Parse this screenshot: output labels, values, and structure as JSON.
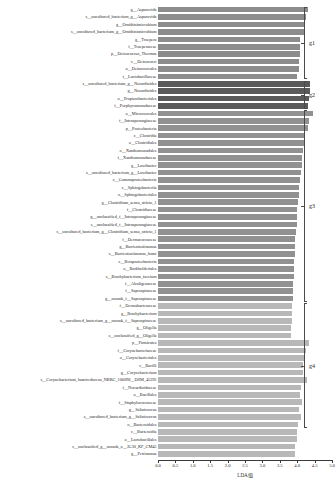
{
  "chart_data": {
    "type": "bar",
    "orientation": "horizontal",
    "title": "",
    "xlabel": "LDA值",
    "ylabel": "",
    "xlim": [
      0.0,
      5.0
    ],
    "grid": false,
    "legend_position": "right-brackets",
    "xticks": [
      "0.0",
      "0.5",
      "1.0",
      "1.5",
      "2.0",
      "2.5",
      "3.0",
      "3.5",
      "4.0",
      "4.5",
      "5.0"
    ],
    "xtick_values": [
      0.0,
      0.5,
      1.0,
      1.5,
      2.0,
      2.5,
      3.0,
      3.5,
      4.0,
      4.5,
      5.0
    ],
    "groups": [
      {
        "name": "g1",
        "color": "#8c8c8c",
        "start_index": 0,
        "count": 10
      },
      {
        "name": "g2",
        "color": "#5a5a5a",
        "start_index": 10,
        "count": 4
      },
      {
        "name": "g3",
        "color": "#919191",
        "start_index": 14,
        "count": 26
      },
      {
        "name": "g4",
        "color": "#b8b8b8",
        "start_index": 40,
        "count": 17
      }
    ],
    "categories": [
      "g__Asparovida",
      "s__uncultured_bacterium_g__Asparovida",
      "g__Ornithinimicrobium",
      "s__uncultured_bacterium_g__Ornithinimicrobium",
      "g__Truepera",
      "f__Trueperaceae",
      "p__Deinococcus_Thermus",
      "c__Deinococci",
      "o__Deinococcales",
      "f__Lactobacillaceae",
      "s__uncultured_bacterium_g__Nocardioides",
      "g__Nocardioides",
      "o__Propionibacteriales",
      "f__Porphyromonadaceae",
      "o__Micrococcales",
      "f__Intrasporangiaceae",
      "p__Proteobacteria",
      "c__Clostridia",
      "o__Clostridiales",
      "o__Xanthomonadales",
      "f__Xanthomonadaceae",
      "g__Lawibacter",
      "s__uncultured_bacterium_g__Lawibacter",
      "c__Gammaproteobacteria",
      "c__Sphingobacteriia",
      "o__Sphingobacteriales",
      "g__Clostridium_sensu_stricto_1",
      "f__Clostridiaceae",
      "g__unclassified_f__Intrasporangiaceae",
      "s__unclassified_f__Intrasporangiaceae",
      "s__uncultured_bacterium_g__Clostridium_sensu_stricto_1",
      "f__Dermacoccaceae",
      "g__Barrientosiimonas",
      "s__Barrientosiimonas_humi",
      "c__Betaproteobacteria",
      "o__Burkholderiales",
      "s__Brachybacterium_faecium",
      "f__Alcaligenaceae",
      "f__Saprospiraceae",
      "g__norank_f__Saprospiraceae",
      "f__Dermabacteraceae",
      "g__Brachybacterium",
      "s__uncultured_bacterium_g__norank_f__Saprospiraceae",
      "g__Oligella",
      "s__unclassified_g__Oligella",
      "p__Firmicutes",
      "f__Corynebacteriaceae",
      "o__Corynebacteriales",
      "c__Bacilli",
      "g__Corynebacterium",
      "s__Corynebacterium_humireducens_NBRC_106098__DSM_45392",
      "f__Nocardioidaceae",
      "o__Bacillales",
      "f__Staphylococcaceae",
      "g__Salinicoccus",
      "s__uncultured_bacterium_g__Salinicoccus",
      "o__Bacteroidales",
      "c__Bacteroidia",
      "o__Lactobacillales",
      "s__unclassified_g__norank_o__JG30_KF_CM45",
      "g__Petrimonas"
    ],
    "values": [
      4.3,
      4.25,
      4.22,
      4.2,
      4.08,
      4.08,
      4.07,
      4.06,
      4.06,
      3.98,
      4.36,
      4.38,
      4.34,
      4.3,
      4.44,
      4.34,
      4.31,
      4.2,
      4.19,
      4.16,
      4.15,
      4.13,
      4.12,
      4.09,
      4.06,
      4.05,
      4.02,
      4.0,
      3.99,
      3.98,
      3.97,
      3.95,
      3.94,
      3.93,
      3.92,
      3.91,
      3.9,
      3.89,
      3.88,
      3.87,
      3.86,
      3.85,
      3.84,
      3.83,
      3.82,
      4.33,
      4.26,
      4.22,
      4.18,
      4.16,
      4.28,
      4.1,
      4.07,
      4.15,
      4.06,
      4.12,
      4.03,
      4.0,
      3.98,
      3.95,
      3.93
    ]
  },
  "axis": {
    "xlabel": "LDA值"
  }
}
